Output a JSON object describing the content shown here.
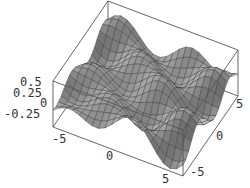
{
  "chart_data": {
    "type": "surface3d",
    "title": "",
    "xlabel": "",
    "ylabel": "",
    "zlabel": "",
    "x_range": [
      -6,
      6
    ],
    "y_range": [
      -6,
      6
    ],
    "z_range": [
      -0.35,
      0.55
    ],
    "x_ticks": [
      "-5",
      "0",
      "5"
    ],
    "y_ticks": [
      "-5",
      "0",
      "5"
    ],
    "z_ticks": [
      "0.5",
      "0.25",
      "0",
      "-0.25"
    ],
    "grid_resolution": 20,
    "function_description": "oscillating surface ~0.5*sin(x)*cos(y) style, with ridges and valleys",
    "boxed": true,
    "shading": "grayscale",
    "colors": {
      "box": "#555555",
      "mesh": "#333333",
      "surface_light": "#e6e6e6",
      "surface_dark": "#505050"
    }
  },
  "labels": {
    "z": [
      {
        "text": "0.5",
        "x": 20,
        "y": 86
      },
      {
        "text": "0.25",
        "x": 13,
        "y": 97
      },
      {
        "text": "0",
        "x": 40,
        "y": 107
      },
      {
        "text": "-0.25",
        "x": 4,
        "y": 118
      }
    ],
    "x": [
      {
        "text": "-5",
        "x": 52,
        "y": 143
      },
      {
        "text": "0",
        "x": 106,
        "y": 160
      },
      {
        "text": "5",
        "x": 162,
        "y": 183
      }
    ],
    "y": [
      {
        "text": "-5",
        "x": 190,
        "y": 176
      },
      {
        "text": "0",
        "x": 216,
        "y": 140
      },
      {
        "text": "5",
        "x": 236,
        "y": 108
      }
    ]
  }
}
